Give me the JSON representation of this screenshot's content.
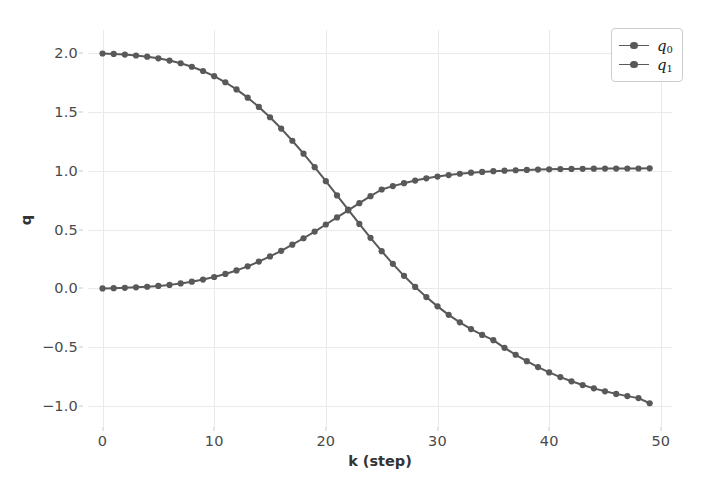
{
  "chart_data": {
    "type": "line",
    "title": "",
    "xlabel": "k (step)",
    "ylabel": "q",
    "xlim": [
      -1.3,
      51.0
    ],
    "ylim": [
      -1.18,
      2.2
    ],
    "xticks": [
      0,
      10,
      20,
      30,
      40,
      50
    ],
    "xtick_labels": [
      "0",
      "10",
      "20",
      "30",
      "40",
      "50"
    ],
    "yticks": [
      2.0,
      1.5,
      1.0,
      0.5,
      0.0,
      -0.5,
      -1.0
    ],
    "ytick_labels": [
      "2.0",
      "1.5",
      "1.0",
      "0.5",
      "0.0",
      "−0.5",
      "−1.0"
    ],
    "grid": true,
    "legend_position": "upper right",
    "marker": "circle",
    "line_color": "#595959",
    "grid_color": "#eaeaea",
    "background": "#ffffff",
    "x": [
      0,
      1,
      2,
      3,
      4,
      5,
      6,
      7,
      8,
      9,
      10,
      11,
      12,
      13,
      14,
      15,
      16,
      17,
      18,
      19,
      20,
      21,
      22,
      23,
      24,
      25,
      26,
      27,
      28,
      29,
      30,
      31,
      32,
      33,
      34,
      35,
      36,
      37,
      38,
      39,
      40,
      41,
      42,
      43,
      44,
      45,
      46,
      47,
      48,
      49
    ],
    "series": [
      {
        "name": "q_0",
        "label_base": "q",
        "label_sub": "0",
        "color": "#595959",
        "values": [
          2.0,
          1.996,
          1.991,
          1.983,
          1.973,
          1.959,
          1.94,
          1.917,
          1.887,
          1.851,
          1.807,
          1.755,
          1.694,
          1.624,
          1.545,
          1.457,
          1.361,
          1.257,
          1.147,
          1.032,
          0.913,
          0.792,
          0.67,
          0.549,
          0.431,
          0.317,
          0.209,
          0.107,
          0.013,
          -0.074,
          -0.153,
          -0.225,
          -0.289,
          -0.346,
          -0.396,
          -0.441,
          -0.506,
          -0.565,
          -0.62,
          -0.67,
          -0.715,
          -0.755,
          -0.791,
          -0.823,
          -0.851,
          -0.876,
          -0.898,
          -0.917,
          -0.934,
          -0.978
        ]
      },
      {
        "name": "q_1",
        "label_base": "q",
        "label_sub": "1",
        "color": "#595959",
        "values": [
          0.0,
          0.002,
          0.005,
          0.009,
          0.014,
          0.021,
          0.03,
          0.042,
          0.057,
          0.075,
          0.097,
          0.123,
          0.153,
          0.188,
          0.228,
          0.272,
          0.32,
          0.372,
          0.427,
          0.484,
          0.544,
          0.604,
          0.665,
          0.726,
          0.785,
          0.842,
          0.871,
          0.896,
          0.918,
          0.937,
          0.952,
          0.965,
          0.976,
          0.985,
          0.992,
          0.998,
          1.002,
          1.006,
          1.009,
          1.012,
          1.014,
          1.016,
          1.017,
          1.018,
          1.019,
          1.02,
          1.02,
          1.021,
          1.021,
          1.022
        ]
      }
    ]
  }
}
